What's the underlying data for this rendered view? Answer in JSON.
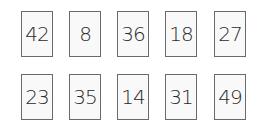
{
  "cards": {
    "row1": [
      "42",
      "8",
      "36",
      "18",
      "27"
    ],
    "row2": [
      "23",
      "35",
      "14",
      "31",
      "49"
    ]
  }
}
